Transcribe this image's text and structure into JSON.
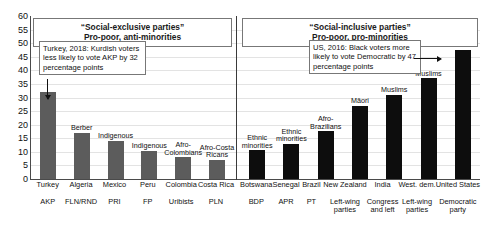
{
  "chart_data": {
    "type": "bar",
    "title": "",
    "xlabel": "",
    "ylabel": "",
    "ylim": [
      0,
      60
    ],
    "ytick_step": 5,
    "yticks": [
      "60",
      "55",
      "50",
      "45",
      "40",
      "35",
      "30",
      "25",
      "20",
      "15",
      "10",
      "5",
      "0"
    ],
    "grid": true,
    "legend": "none",
    "panels": [
      {
        "header_line1": "“Social-exclusive parties”",
        "header_line2": "Pro-poor, anti-minorities",
        "bar_color": "#5c5c5c",
        "annotation": "Turkey, 2018: Kurdish voters less likely to vote AKP by 32 percentage points",
        "categories": [
          "Turkey",
          "Algeria",
          "Mexico",
          "Peru",
          "Colombia",
          "Costa Rica"
        ],
        "parties": [
          "AKP",
          "FLN/RND",
          "PRI",
          "FP",
          "Uribists",
          "PLN"
        ],
        "group_labels": [
          "",
          "Berber",
          "Indigenous",
          "Indigenous",
          "Afro-\nColombians",
          "Afro-Costa\nRicans"
        ],
        "values": [
          32,
          17,
          14,
          10.3,
          8,
          7
        ]
      },
      {
        "header_line1": "“Social-inclusive parties”",
        "header_line2": "Pro-poor, pro-minorities",
        "bar_color": "#0d0d0d",
        "annotation": "US, 2016: Black voters more likely to vote Democratic by 47 percentage points",
        "categories": [
          "Botswana",
          "Senegal",
          "Brazil",
          "New Zealand",
          "India",
          "West. dem.",
          "United States"
        ],
        "parties": [
          "BDP",
          "APR",
          "PT",
          "Left-wing\nparties",
          "Congress\nand left",
          "Left-wing\nparties",
          "Democratic\nparty"
        ],
        "group_labels": [
          "Ethnic\nminorities",
          "Ethnic\nminorities",
          "Afro-\nBrazilians",
          "Māori",
          "Muslims",
          "Muslims",
          ""
        ],
        "values": [
          10.5,
          13,
          17.5,
          27,
          31,
          37,
          47.5
        ]
      }
    ]
  },
  "colors": {
    "exclusive_bar": "#5c5c5c",
    "inclusive_bar": "#0d0d0d",
    "axis": "#4a4a4a",
    "grid": "#e3e3e3",
    "box_border": "#777777",
    "background": "#ffffff"
  }
}
